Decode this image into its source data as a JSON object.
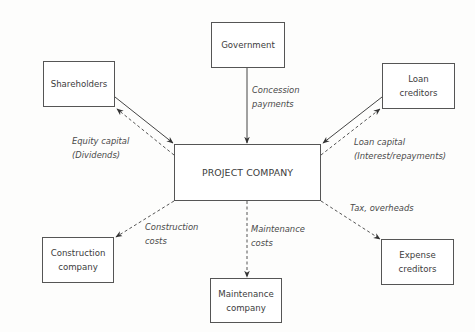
{
  "nodes": {
    "government": "Government",
    "shareholders": "Shareholders",
    "loan_creditors": [
      "Loan",
      "creditors"
    ],
    "project_company": "PROJECT COMPANY",
    "construction_company": [
      "Construction",
      "company"
    ],
    "maintenance_company": [
      "Maintenance",
      "company"
    ],
    "expense_creditors": [
      "Expense",
      "creditors"
    ]
  },
  "edges": {
    "concession": [
      "Concession",
      "payments"
    ],
    "equity": [
      "Equity capital",
      "(Dividends)"
    ],
    "loan": [
      "Loan capital",
      "(Interest/repayments)"
    ],
    "construction": [
      "Construction",
      "costs"
    ],
    "maintenance": [
      "Maintenance",
      "costs"
    ],
    "tax": "Tax, overheads"
  }
}
